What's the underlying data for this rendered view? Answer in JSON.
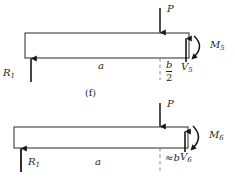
{
  "figure": {
    "type": "free-body-diagram",
    "caption": "(f)",
    "panels": [
      {
        "id": "upper",
        "beam": {
          "x": 25,
          "y": 33,
          "width": 164,
          "height": 25
        },
        "labels": {
          "load": "P",
          "reaction": "R",
          "reaction_sub": "1",
          "span": "a",
          "offset_num": "b",
          "offset_den": "2",
          "shear": "V",
          "shear_sub": "5",
          "moment": "M",
          "moment_sub": "5"
        }
      },
      {
        "id": "lower",
        "beam": {
          "x": 14,
          "y": 127,
          "width": 174,
          "height": 21
        },
        "labels": {
          "load": "P",
          "reaction": "R",
          "reaction_sub": "1",
          "span": "a",
          "offset_approx": "≈",
          "offset": "b",
          "shear": "V",
          "shear_sub": "6",
          "moment": "M",
          "moment_sub": "6"
        }
      }
    ],
    "colors": {
      "beam_stroke": "#3d3d3d",
      "arrow": "#161616",
      "dashed": "#8a8a8a",
      "text": "#1f1f1f"
    }
  }
}
